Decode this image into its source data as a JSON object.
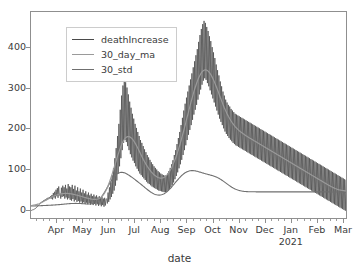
{
  "chart_data": {
    "type": "line",
    "title": "",
    "xlabel": "date",
    "ylabel": "",
    "ylim": [
      -18,
      492
    ],
    "xlim": [
      "2020-03-05",
      "2021-03-07"
    ],
    "grid": false,
    "legend_position": "upper left",
    "yticks": [
      0,
      100,
      200,
      300,
      400
    ],
    "ytick_labels": [
      "0",
      "100",
      "200",
      "300",
      "400"
    ],
    "xticks": [
      "Apr",
      "May",
      "Jun",
      "Jul",
      "Aug",
      "Sep",
      "Oct",
      "Nov",
      "Dec",
      "Jan",
      "Feb",
      "Mar"
    ],
    "xtick_sublabels": [
      "",
      "",
      "",
      "",
      "",
      "",
      "",
      "",
      "",
      "2021",
      "",
      ""
    ],
    "colors": {
      "deathIncrease": "#4a4a4a",
      "30_day_ma": "#9a9a9a",
      "30_std": "#6f6f6f",
      "axis": "#8f8f8f",
      "text": "#3b3b3b",
      "background": "#ffffff"
    },
    "series": [
      {
        "name": "deathIncrease",
        "color": "#4a4a4a",
        "values": [
          0,
          1,
          2,
          2,
          3,
          4,
          5,
          6,
          8,
          9,
          11,
          13,
          15,
          17,
          19,
          21,
          20,
          24,
          22,
          26,
          24,
          28,
          26,
          30,
          27,
          32,
          29,
          34,
          31,
          36,
          30,
          39,
          28,
          44,
          33,
          47,
          30,
          52,
          36,
          56,
          32,
          60,
          38,
          42,
          30,
          57,
          34,
          62,
          36,
          58,
          30,
          64,
          33,
          55,
          28,
          66,
          31,
          60,
          27,
          58,
          25,
          64,
          29,
          54,
          23,
          62,
          27,
          50,
          22,
          58,
          24,
          48,
          20,
          55,
          23,
          45,
          18,
          52,
          21,
          43,
          17,
          48,
          20,
          40,
          16,
          45,
          19,
          38,
          15,
          42,
          18,
          36,
          14,
          40,
          17,
          35,
          13,
          38,
          16,
          33,
          12,
          36,
          15,
          31,
          11,
          34,
          14,
          30,
          10,
          32,
          13,
          28,
          30,
          18,
          45,
          22,
          58,
          28,
          70,
          34,
          88,
          42,
          105,
          50,
          130,
          62,
          155,
          75,
          185,
          92,
          215,
          110,
          250,
          130,
          285,
          150,
          310,
          168,
          322,
          175,
          318,
          170,
          305,
          160,
          288,
          150,
          270,
          140,
          255,
          132,
          240,
          124,
          228,
          118,
          215,
          110,
          205,
          104,
          195,
          98,
          185,
          92,
          175,
          88,
          168,
          84,
          160,
          80,
          152,
          76,
          145,
          72,
          138,
          68,
          132,
          66,
          126,
          63,
          120,
          60,
          115,
          58,
          110,
          56,
          106,
          54,
          102,
          52,
          98,
          50,
          95,
          49,
          92,
          48,
          90,
          47,
          88,
          46,
          87,
          46,
          88,
          47,
          92,
          50,
          98,
          54,
          106,
          58,
          115,
          64,
          125,
          70,
          138,
          78,
          150,
          86,
          165,
          95,
          180,
          105,
          195,
          115,
          212,
          126,
          230,
          138,
          248,
          150,
          265,
          162,
          280,
          175,
          295,
          188,
          310,
          200,
          325,
          212,
          340,
          225,
          355,
          238,
          370,
          250,
          385,
          262,
          400,
          275,
          418,
          288,
          435,
          300,
          450,
          312,
          462,
          322,
          470,
          328,
          465,
          324,
          455,
          316,
          445,
          308,
          432,
          298,
          420,
          288,
          405,
          278,
          392,
          268,
          378,
          258,
          362,
          248,
          348,
          238,
          335,
          228,
          320,
          220,
          308,
          212,
          295,
          204,
          285,
          196,
          275,
          190,
          268,
          185,
          262,
          180,
          258,
          176,
          252,
          172,
          248,
          168,
          244,
          165,
          240,
          162,
          238,
          160,
          236,
          158,
          234,
          156,
          232,
          154,
          230,
          152,
          228,
          150,
          226,
          148,
          224,
          146,
          222,
          144,
          220,
          142,
          218,
          140,
          216,
          138,
          214,
          136,
          212,
          134,
          210,
          132,
          208,
          130,
          206,
          128,
          204,
          126,
          202,
          124,
          200,
          122,
          198,
          120,
          196,
          118,
          194,
          116,
          192,
          114,
          190,
          112,
          188,
          110,
          186,
          108,
          184,
          106,
          182,
          104,
          180,
          102,
          178,
          100,
          176,
          98,
          174,
          96,
          172,
          94,
          170,
          92,
          168,
          90,
          166,
          88,
          164,
          86,
          162,
          84,
          160,
          82,
          158,
          80,
          156,
          78,
          154,
          76,
          152,
          74,
          150,
          72,
          148,
          70,
          146,
          68,
          144,
          66,
          142,
          64,
          140,
          62,
          138,
          60,
          136,
          58,
          134,
          56,
          132,
          54,
          130,
          52,
          128,
          50,
          126,
          48,
          124,
          46,
          122,
          44,
          120,
          42,
          118,
          40,
          116,
          38,
          114,
          36,
          112,
          34,
          110,
          32,
          108,
          30,
          106,
          28,
          104,
          26,
          102,
          24,
          100,
          22,
          98,
          20,
          96,
          18,
          94,
          16,
          92,
          14,
          90,
          12,
          88,
          10,
          86,
          8,
          84,
          6,
          82,
          4,
          80,
          2,
          78,
          0,
          76
        ]
      },
      {
        "name": "30_day_ma",
        "color": "#9a9a9a",
        "description": "30-day moving average, smooth curve",
        "key_points": [
          {
            "date": "Mar",
            "value": 2
          },
          {
            "date": "Apr",
            "value": 18
          },
          {
            "date": "May",
            "value": 28
          },
          {
            "date": "Jun",
            "value": 28
          },
          {
            "date": "Jul",
            "value": 32
          },
          {
            "date": "mid-Jul",
            "value": 90
          },
          {
            "date": "early-Aug",
            "value": 205
          },
          {
            "date": "Sep",
            "value": 160
          },
          {
            "date": "Oct",
            "value": 105
          },
          {
            "date": "Nov",
            "value": 95
          },
          {
            "date": "Dec",
            "value": 150
          },
          {
            "date": "Jan",
            "value": 230
          },
          {
            "date": "mid-Jan",
            "value": 320
          },
          {
            "date": "Feb",
            "value": 300
          },
          {
            "date": "Mar",
            "value": 215
          }
        ]
      },
      {
        "name": "30_std",
        "color": "#6f6f6f",
        "description": "30-day rolling standard deviation, smooth lower curve",
        "key_points": [
          {
            "date": "Mar",
            "value": 1
          },
          {
            "date": "Apr",
            "value": 14
          },
          {
            "date": "May",
            "value": 20
          },
          {
            "date": "Jun",
            "value": 18
          },
          {
            "date": "Jul",
            "value": 24
          },
          {
            "date": "mid-Jul",
            "value": 52
          },
          {
            "date": "Aug",
            "value": 88
          },
          {
            "date": "Sep",
            "value": 82
          },
          {
            "date": "Oct",
            "value": 58
          },
          {
            "date": "Nov",
            "value": 50
          },
          {
            "date": "Dec",
            "value": 78
          },
          {
            "date": "Jan",
            "value": 110
          },
          {
            "date": "mid-Jan",
            "value": 138
          },
          {
            "date": "Feb",
            "value": 145
          },
          {
            "date": "Mar",
            "value": 128
          }
        ]
      }
    ]
  },
  "legend": {
    "items": [
      {
        "label": "deathIncrease",
        "color": "#4a4a4a"
      },
      {
        "label": "30_day_ma",
        "color": "#9a9a9a"
      },
      {
        "label": "30_std",
        "color": "#6f6f6f"
      }
    ]
  },
  "axis": {
    "xlabel": "date",
    "ytick_labels": [
      "400",
      "300",
      "200",
      "100",
      "0"
    ],
    "xtick_labels": [
      "Apr",
      "May",
      "Jun",
      "Jul",
      "Aug",
      "Sep",
      "Oct",
      "Nov",
      "Dec",
      "Jan",
      "Feb",
      "Mar"
    ],
    "year_label": "2021"
  }
}
